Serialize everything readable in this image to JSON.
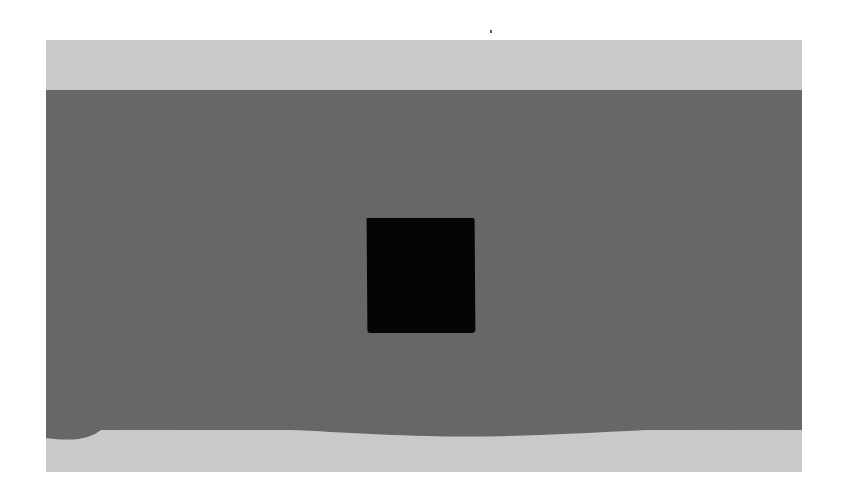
{
  "artwork": {
    "description": "Grayscale abstract painting: light gray field with a broad dark gray horizontal band and a black square in the center",
    "colors": {
      "background": "#ffffff",
      "field": "#c9c9c9",
      "band": "#676767",
      "square": "#050505"
    }
  }
}
